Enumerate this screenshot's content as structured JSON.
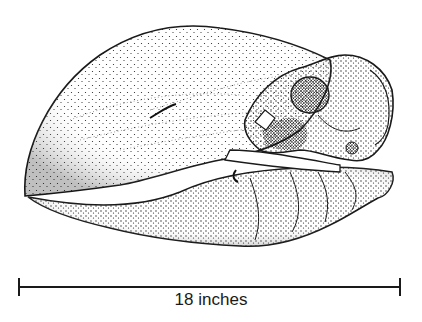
{
  "figure": {
    "ink_color": "#1a1a1a",
    "background": "#ffffff"
  },
  "scale": {
    "label": "18 inches"
  }
}
